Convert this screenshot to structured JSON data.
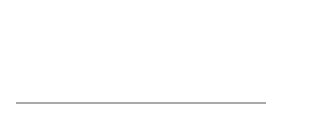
{
  "figure": {
    "callouts": [
      {
        "label": "Link 0",
        "text_x": 52,
        "text_y": 16,
        "line": [
          50,
          13,
          28,
          44
        ]
      },
      {
        "label": "Link 5",
        "text_x": 174,
        "text_y": 16,
        "line": [
          172,
          13,
          145,
          44
        ]
      }
    ],
    "axis": {
      "label": "x (cm)",
      "ticks": [
        "0",
        "2",
        "4",
        "6",
        "8",
        "10"
      ]
    },
    "spring": {
      "links": 11,
      "x_start": 0,
      "x_end": 10
    }
  }
}
